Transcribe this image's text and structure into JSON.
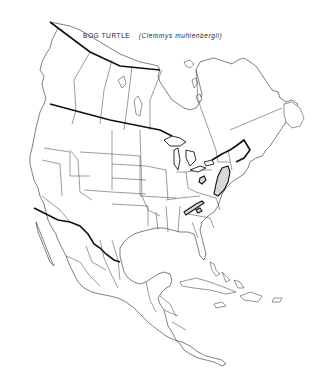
{
  "map": {
    "title": {
      "common_name": "BOG TURTLE",
      "scientific_name": "(Clemmys muhlenbergii)"
    },
    "region": "North America",
    "style": {
      "background": "#ffffff",
      "line_color": "#2a2a2a",
      "international_border_color": "#111111",
      "range_fill": "#d8d8d8"
    },
    "legend": {
      "range_areas": [
        {
          "name": "range-northeast",
          "description": "New York / Pennsylvania / New Jersey area"
        },
        {
          "name": "range-lake-erie",
          "description": "Small area near western New York / Ohio"
        },
        {
          "name": "range-southern-appalachians",
          "description": "Virginia / North Carolina mountains"
        }
      ]
    }
  }
}
